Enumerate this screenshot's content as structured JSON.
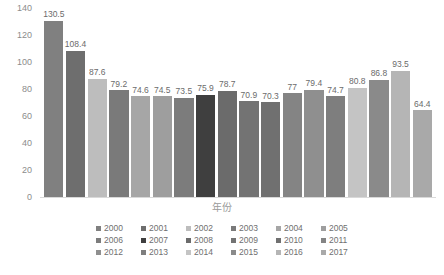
{
  "chart_data": {
    "type": "bar",
    "title": "",
    "xlabel": "年份",
    "ylabel": "",
    "ylim": [
      0,
      140
    ],
    "ytick_step": 20,
    "yticks": [
      "140",
      "120",
      "100",
      "80",
      "60",
      "40",
      "20",
      "0"
    ],
    "grid": false,
    "legend_position": "bottom",
    "categories": [
      "2000",
      "2001",
      "2002",
      "2003",
      "2004",
      "2005",
      "2006",
      "2007",
      "2008",
      "2009",
      "2010",
      "2011",
      "2012",
      "2013",
      "2014",
      "2015",
      "2016",
      "2017"
    ],
    "values": [
      130.5,
      108.4,
      87.6,
      79.2,
      74.6,
      74.5,
      73.5,
      75.9,
      78.7,
      70.9,
      70.3,
      77,
      79.4,
      74.7,
      80.8,
      86.8,
      93.5,
      64.4
    ],
    "value_labels": [
      "130.5",
      "108.4",
      "87.6",
      "79.2",
      "74.6",
      "74.5",
      "73.5",
      "75.9",
      "78.7",
      "70.9",
      "70.3",
      "77",
      "79.4",
      "74.7",
      "80.8",
      "86.8",
      "93.5",
      "64.4"
    ],
    "colors": [
      "#808080",
      "#6e6e6e",
      "#bdbdbd",
      "#7a7a7a",
      "#a6a6a6",
      "#9e9e9e",
      "#7c7c7c",
      "#3f3f3f",
      "#6b6b6b",
      "#737373",
      "#707070",
      "#848484",
      "#8f8f8f",
      "#7e7e7e",
      "#c4c4c4",
      "#8a8a8a",
      "#b5b5b5",
      "#a9a9a9"
    ],
    "series": [
      {
        "name": "年份",
        "values": [
          130.5,
          108.4,
          87.6,
          79.2,
          74.6,
          74.5,
          73.5,
          75.9,
          78.7,
          70.9,
          70.3,
          77,
          79.4,
          74.7,
          80.8,
          86.8,
          93.5,
          64.4
        ]
      }
    ]
  },
  "legend": {
    "items": [
      {
        "label": "2000",
        "color": "#808080"
      },
      {
        "label": "2001",
        "color": "#6e6e6e"
      },
      {
        "label": "2002",
        "color": "#bdbdbd"
      },
      {
        "label": "2003",
        "color": "#7a7a7a"
      },
      {
        "label": "2004",
        "color": "#a6a6a6"
      },
      {
        "label": "2005",
        "color": "#9e9e9e"
      },
      {
        "label": "2006",
        "color": "#7c7c7c"
      },
      {
        "label": "2007",
        "color": "#3f3f3f"
      },
      {
        "label": "2008",
        "color": "#6b6b6b"
      },
      {
        "label": "2009",
        "color": "#737373"
      },
      {
        "label": "2010",
        "color": "#707070"
      },
      {
        "label": "2011",
        "color": "#848484"
      },
      {
        "label": "2012",
        "color": "#8f8f8f"
      },
      {
        "label": "2013",
        "color": "#7e7e7e"
      },
      {
        "label": "2014",
        "color": "#c4c4c4"
      },
      {
        "label": "2015",
        "color": "#8a8a8a"
      },
      {
        "label": "2016",
        "color": "#b5b5b5"
      },
      {
        "label": "2017",
        "color": "#a9a9a9"
      }
    ]
  }
}
